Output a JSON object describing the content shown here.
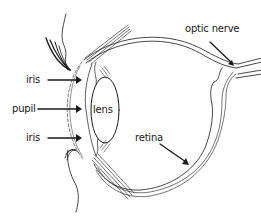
{
  "diagram": {
    "colors": {
      "line": "#1a1a1a",
      "background": "#ffffff"
    },
    "labels": {
      "iris_top": "iris",
      "pupil": "pupil",
      "iris_bottom": "iris",
      "lens": "lens",
      "optic_nerve": "optic nerve",
      "retina": "retina"
    }
  }
}
